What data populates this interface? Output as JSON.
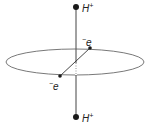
{
  "figure": {
    "top_nucleus": {
      "label": "H",
      "charge": "+"
    },
    "bottom_nucleus": {
      "label": "H",
      "charge": "+"
    },
    "electron_upper": {
      "charge": "−",
      "label": "e"
    },
    "electron_lower": {
      "charge": "−",
      "label": "e"
    },
    "colors": {
      "line": "#333333",
      "dot": "#1a1a1a",
      "text": "#222222"
    }
  }
}
